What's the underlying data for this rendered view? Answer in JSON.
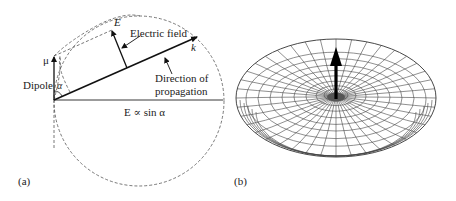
{
  "panel_a": {
    "label": "(a)",
    "mu_label": "μ",
    "dipole_label": "Dipole",
    "alpha_label": "α",
    "e_label": "E",
    "electric_field_label": "Electric field",
    "k_label": "k",
    "propagation_label_line1": "Direction of",
    "propagation_label_line2": "propagation",
    "formula_label": "E ∝ sin α"
  },
  "panel_b": {
    "label": "(b)"
  }
}
